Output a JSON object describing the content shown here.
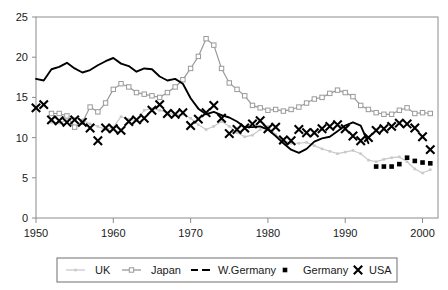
{
  "chart_data": {
    "type": "line",
    "title": "",
    "xlabel": "",
    "ylabel": "",
    "xlim": [
      1950,
      2002
    ],
    "ylim": [
      0,
      25
    ],
    "yticks": [
      0,
      5,
      10,
      15,
      20,
      25
    ],
    "xticks": [
      1950,
      1960,
      1970,
      1980,
      1990,
      2000
    ],
    "grid": false,
    "legend_position": "bottom",
    "series": [
      {
        "name": "UK",
        "color": "#c9c9c9",
        "marker": "small-square",
        "style": "line-with-markers",
        "x": [
          1952,
          1953,
          1954,
          1955,
          1956,
          1957,
          1958,
          1959,
          1960,
          1961,
          1962,
          1963,
          1964,
          1965,
          1966,
          1967,
          1968,
          1969,
          1970,
          1971,
          1972,
          1973,
          1974,
          1975,
          1976,
          1977,
          1978,
          1979,
          1980,
          1981,
          1982,
          1983,
          1984,
          1985,
          1986,
          1987,
          1988,
          1989,
          1990,
          1991,
          1992,
          1993,
          1994,
          1995,
          1996,
          1997,
          1998,
          1999,
          2000,
          2001
        ],
        "values": [
          11.9,
          11.8,
          12.2,
          12.4,
          12.2,
          11.7,
          11.4,
          11.0,
          11.3,
          12.6,
          12.3,
          12.1,
          13.4,
          13.6,
          13.4,
          13.1,
          12.8,
          12.9,
          12.4,
          11.6,
          11.0,
          11.4,
          12.0,
          11.4,
          10.6,
          10.1,
          10.3,
          11.0,
          11.4,
          10.4,
          9.7,
          9.3,
          9.3,
          9.4,
          9.0,
          8.6,
          8.3,
          8.0,
          8.2,
          8.4,
          8.0,
          7.2,
          7.0,
          7.3,
          7.5,
          7.6,
          7.0,
          6.1,
          5.6,
          6.0
        ]
      },
      {
        "name": "Japan",
        "color": "#9a9a9a",
        "marker": "open-square",
        "style": "line-with-markers",
        "x": [
          1952,
          1953,
          1954,
          1955,
          1956,
          1957,
          1958,
          1959,
          1960,
          1961,
          1962,
          1963,
          1964,
          1965,
          1966,
          1967,
          1968,
          1969,
          1970,
          1971,
          1972,
          1973,
          1974,
          1975,
          1976,
          1977,
          1978,
          1979,
          1980,
          1981,
          1982,
          1983,
          1984,
          1985,
          1986,
          1987,
          1988,
          1989,
          1990,
          1991,
          1992,
          1993,
          1994,
          1995,
          1996,
          1997,
          1998,
          1999,
          2000,
          2001
        ],
        "values": [
          13.0,
          13.0,
          12.7,
          11.3,
          11.9,
          13.8,
          13.2,
          14.3,
          16.0,
          16.7,
          16.3,
          15.6,
          15.4,
          15.2,
          15.0,
          15.6,
          16.3,
          17.2,
          18.6,
          20.1,
          22.3,
          21.5,
          18.6,
          16.8,
          16.0,
          15.2,
          14.0,
          13.7,
          13.4,
          13.5,
          13.3,
          13.5,
          13.8,
          14.3,
          14.8,
          15.0,
          15.5,
          15.9,
          15.6,
          15.1,
          14.0,
          13.5,
          13.1,
          12.9,
          12.9,
          13.4,
          13.7,
          13.0,
          13.1,
          13.0
        ]
      },
      {
        "name": "W.Germany",
        "color": "#000000",
        "marker": "none",
        "style": "line",
        "x": [
          1950,
          1951,
          1952,
          1953,
          1954,
          1955,
          1956,
          1957,
          1958,
          1959,
          1960,
          1961,
          1962,
          1963,
          1964,
          1965,
          1966,
          1967,
          1968,
          1969,
          1970,
          1971,
          1972,
          1973,
          1974,
          1975,
          1976,
          1977,
          1978,
          1979,
          1980,
          1981,
          1982,
          1983,
          1984,
          1985,
          1986,
          1987,
          1988,
          1989,
          1990,
          1991,
          1992,
          1993
        ],
        "values": [
          17.3,
          17.1,
          18.5,
          18.8,
          19.3,
          18.6,
          18.1,
          18.4,
          19.0,
          19.5,
          19.9,
          19.2,
          18.9,
          18.2,
          18.6,
          18.5,
          17.6,
          17.1,
          17.3,
          16.7,
          14.9,
          13.6,
          12.9,
          13.2,
          12.8,
          12.5,
          12.0,
          11.3,
          11.3,
          11.4,
          11.0,
          10.2,
          9.3,
          8.5,
          8.1,
          8.6,
          9.5,
          9.9,
          10.1,
          10.8,
          11.5,
          11.9,
          11.5,
          9.3
        ]
      },
      {
        "name": "Germany",
        "color": "#000000",
        "marker": "filled-square",
        "style": "markers",
        "x": [
          1994,
          1995,
          1996,
          1997,
          1998,
          1999,
          2000,
          2001
        ],
        "values": [
          6.4,
          6.4,
          6.4,
          6.7,
          7.5,
          7.1,
          6.9,
          6.8
        ]
      },
      {
        "name": "USA",
        "color": "#000000",
        "marker": "cross-x",
        "style": "markers",
        "x": [
          1950,
          1951,
          1952,
          1953,
          1954,
          1955,
          1956,
          1957,
          1958,
          1959,
          1960,
          1961,
          1962,
          1963,
          1964,
          1965,
          1966,
          1967,
          1968,
          1969,
          1970,
          1971,
          1972,
          1973,
          1974,
          1975,
          1976,
          1977,
          1978,
          1979,
          1980,
          1981,
          1982,
          1983,
          1984,
          1985,
          1986,
          1987,
          1988,
          1989,
          1990,
          1991,
          1992,
          1993,
          1994,
          1995,
          1996,
          1997,
          1998,
          1999,
          2000,
          2001
        ],
        "values": [
          13.7,
          14.1,
          12.2,
          12.1,
          11.9,
          12.2,
          11.9,
          11.2,
          9.6,
          11.2,
          11.1,
          10.9,
          12.0,
          12.2,
          12.4,
          13.4,
          14.1,
          13.0,
          12.9,
          13.1,
          11.5,
          12.3,
          13.1,
          14.0,
          12.4,
          10.5,
          11.0,
          11.2,
          11.7,
          12.1,
          11.1,
          11.3,
          9.7,
          9.6,
          11.0,
          10.6,
          10.6,
          11.1,
          11.4,
          11.6,
          11.1,
          10.2,
          9.6,
          10.0,
          10.9,
          11.1,
          11.4,
          11.8,
          11.7,
          11.2,
          10.1,
          8.5
        ]
      }
    ]
  },
  "axes": {
    "y_ticks": [
      "0",
      "5",
      "10",
      "15",
      "20",
      "25"
    ],
    "x_ticks": [
      "1950",
      "1960",
      "1970",
      "1980",
      "1990",
      "2000"
    ]
  },
  "legend": {
    "items": [
      {
        "label": "UK",
        "marker": "small-square",
        "color": "#c9c9c9"
      },
      {
        "label": "Japan",
        "marker": "open-square",
        "color": "#9a9a9a"
      },
      {
        "label": "W.Germany",
        "marker": "none",
        "color": "#000000"
      },
      {
        "label": "Germany",
        "marker": "filled-square",
        "color": "#000000"
      },
      {
        "label": "USA",
        "marker": "cross-x",
        "color": "#000000"
      }
    ]
  }
}
